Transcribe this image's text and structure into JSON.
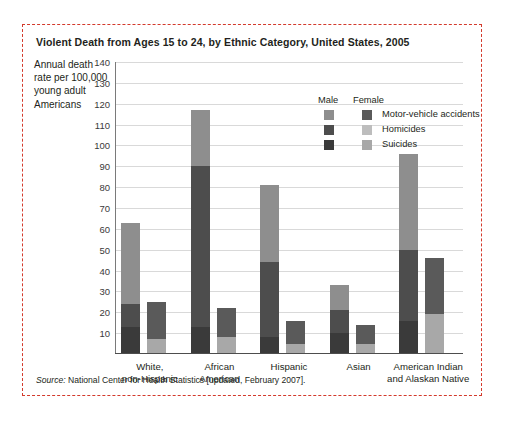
{
  "figure": {
    "title": "Violent Death from Ages 15 to 24, by Ethnic Category, United States, 2005",
    "axis_title": "Annual death rate per 100,000 young adult Americans",
    "source_prefix": "Source:",
    "source_text": "National Center for Health Statistics [updated, February 2007].",
    "border_color": "#d33a2c"
  },
  "legend": {
    "male_header": "Male",
    "female_header": "Female",
    "rows": [
      {
        "label": "Motor-vehicle accidents",
        "male_color": "#8e8e8e",
        "female_color": "#5a5a5a"
      },
      {
        "label": "Homicides",
        "male_color": "#4d4d4d",
        "female_color": "#bdbdbd"
      },
      {
        "label": "Suicides",
        "male_color": "#3a3a3a",
        "female_color": "#a8a8a8"
      }
    ]
  },
  "chart_data": {
    "type": "bar",
    "title": "Violent Death from Ages 15 to 24, by Ethnic Category, United States, 2005",
    "xlabel": "",
    "ylabel": "Annual death rate per 100,000 young adult Americans",
    "ylim": [
      0,
      140
    ],
    "ytick_step": 10,
    "yticks": [
      140,
      130,
      120,
      110,
      100,
      90,
      80,
      70,
      60,
      50,
      40,
      30,
      20,
      10
    ],
    "grid": true,
    "legend_position": "inside-top-right",
    "stacked": true,
    "categories": [
      "White, non-Hispanic",
      "African American",
      "Hispanic",
      "Asian",
      "American Indian and Alaskan Native"
    ],
    "category_lines": [
      [
        "White,",
        "non-Hispanic"
      ],
      [
        "African",
        "American"
      ],
      [
        "Hispanic",
        ""
      ],
      [
        "Asian",
        ""
      ],
      [
        "American Indian",
        "and Alaskan Native"
      ]
    ],
    "series": [
      {
        "name": "Male - Suicides",
        "sex": "Male",
        "cause": "Suicides",
        "color": "#3a3a3a",
        "values": [
          13,
          13,
          8,
          10,
          16
        ]
      },
      {
        "name": "Male - Homicides",
        "sex": "Male",
        "cause": "Homicides",
        "color": "#4d4d4d",
        "values": [
          11,
          77,
          36,
          11,
          34
        ]
      },
      {
        "name": "Male - Motor-vehicle accidents",
        "sex": "Male",
        "cause": "Motor-vehicle accidents",
        "color": "#8e8e8e",
        "values": [
          39,
          27,
          37,
          12,
          46
        ]
      },
      {
        "name": "Female - Suicides",
        "sex": "Female",
        "cause": "Suicides",
        "color": "#a8a8a8",
        "values": [
          7,
          8,
          5,
          5,
          19
        ]
      },
      {
        "name": "Female - Homicides",
        "sex": "Female",
        "cause": "Homicides",
        "color": "#bdbdbd",
        "values": [
          0,
          0,
          0,
          0,
          0
        ]
      },
      {
        "name": "Female - Motor-vehicle accidents",
        "sex": "Female",
        "cause": "Motor-vehicle accidents",
        "color": "#5a5a5a",
        "values": [
          18,
          14,
          11,
          9,
          27
        ]
      }
    ],
    "totals": {
      "male": [
        63,
        117,
        81,
        33,
        96
      ],
      "female": [
        25,
        22,
        16,
        14,
        46
      ]
    }
  }
}
